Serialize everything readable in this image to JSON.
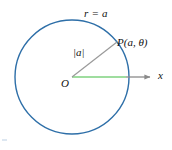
{
  "figure": {
    "title_label": "r = a",
    "point_label": "P(a, θ)",
    "radius_label": "|a|",
    "origin_label": "O",
    "axis_label": "x",
    "colors": {
      "circle": "#2E6FA8",
      "radius_line": "#9A9A9A",
      "green_segment": "#7FD27F",
      "axis": "#8A8A8A",
      "text": "#111111",
      "background": "#FFFFFF"
    },
    "geometry": {
      "center_x": 72,
      "center_y": 77,
      "radius": 57,
      "point_x": 117,
      "point_y": 42,
      "axis_end_x": 156,
      "green_end_x": 126
    }
  }
}
